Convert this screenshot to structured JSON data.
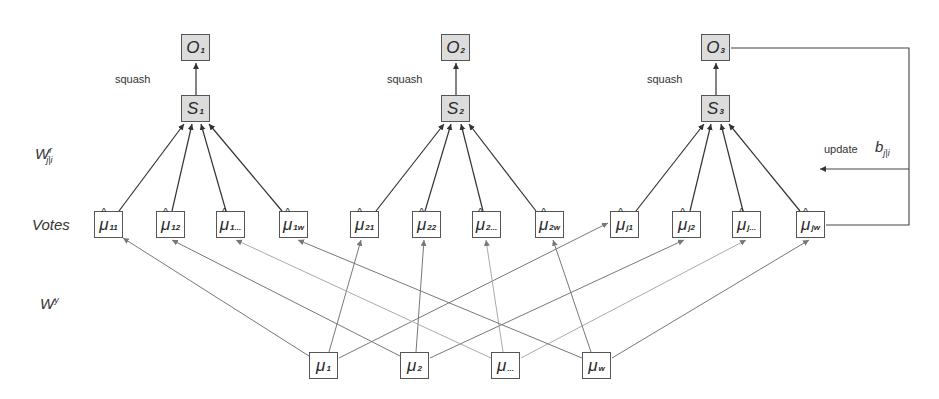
{
  "row_labels": {
    "routing_weights": "W",
    "routing_weights_sup": "r",
    "routing_weights_sub": "j|i",
    "votes": "Votes",
    "transform_weights": "W",
    "transform_weights_sup": "y"
  },
  "outputs": [
    {
      "main": "O",
      "sub": "1"
    },
    {
      "main": "O",
      "sub": "2"
    },
    {
      "main": "O",
      "sub": "3"
    }
  ],
  "sums": [
    {
      "main": "S",
      "sub": "1"
    },
    {
      "main": "S",
      "sub": "2"
    },
    {
      "main": "S",
      "sub": "3"
    }
  ],
  "squash_label": "squash",
  "votes": [
    {
      "main": "μ",
      "sub": "11"
    },
    {
      "main": "μ",
      "sub": "12"
    },
    {
      "main": "μ",
      "sub": "1..."
    },
    {
      "main": "μ",
      "sub": "1w"
    },
    {
      "main": "μ",
      "sub": "21"
    },
    {
      "main": "μ",
      "sub": "22"
    },
    {
      "main": "μ",
      "sub": "2..."
    },
    {
      "main": "μ",
      "sub": "2w"
    },
    {
      "main": "μ",
      "sub": "j1"
    },
    {
      "main": "μ",
      "sub": "j2"
    },
    {
      "main": "μ",
      "sub": "j..."
    },
    {
      "main": "μ",
      "sub": "jw"
    }
  ],
  "inputs": [
    {
      "main": "μ",
      "sub": "1"
    },
    {
      "main": "μ",
      "sub": "2"
    },
    {
      "main": "μ",
      "sub": "..."
    },
    {
      "main": "μ",
      "sub": "w"
    }
  ],
  "feedback": {
    "update_label": "update",
    "b_main": "b",
    "b_sub": "j|i"
  }
}
